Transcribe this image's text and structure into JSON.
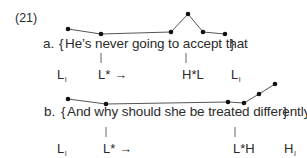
{
  "example_number": "(21)",
  "examples": [
    {
      "label": "a.",
      "open_brace": "{",
      "sentence": "He’s never going to accept that",
      "close_brace": "}",
      "tones": [
        {
          "base": "L",
          "sub": "I"
        },
        {
          "base": "L* →",
          "sub": ""
        },
        {
          "base": "H*L",
          "sub": ""
        },
        {
          "base": "L",
          "sub": "I"
        }
      ],
      "contour_points": [
        [
          68,
          29
        ],
        [
          101,
          34
        ],
        [
          171,
          32
        ],
        [
          188,
          14
        ],
        [
          203,
          32
        ],
        [
          225,
          34
        ]
      ],
      "association_lines": [
        [
          101,
          53,
          101,
          63
        ],
        [
          186,
          53,
          186,
          63
        ]
      ]
    },
    {
      "label": "b.",
      "open_brace": "{",
      "sentence": "And why should she be treated differently",
      "close_brace": "}",
      "tones": [
        {
          "base": "L",
          "sub": "I"
        },
        {
          "base": "L* →",
          "sub": ""
        },
        {
          "base": "L*H",
          "sub": ""
        },
        {
          "base": "H",
          "sub": "I"
        }
      ],
      "contour_points": [
        [
          68,
          99
        ],
        [
          106,
          104
        ],
        [
          228,
          102
        ],
        [
          244,
          103
        ],
        [
          259,
          94
        ],
        [
          275,
          84
        ]
      ],
      "association_lines": [
        [
          106,
          127,
          106,
          137
        ],
        [
          235,
          127,
          235,
          137
        ]
      ]
    }
  ],
  "colors": {
    "ink": "#2b2b2b",
    "line": "#555555",
    "background": "#ffffff"
  }
}
